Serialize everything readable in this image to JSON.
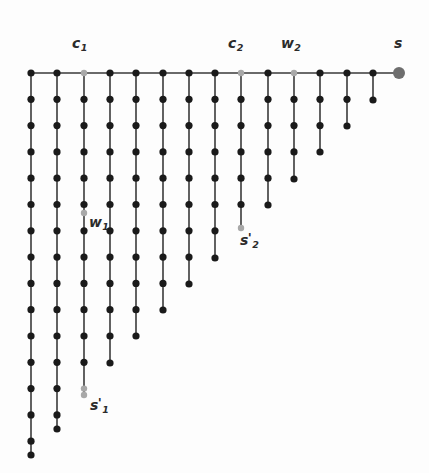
{
  "figure": {
    "background_color": "#fdfdfd",
    "width": 429,
    "height": 473
  },
  "style": {
    "edge_color": "#3a3a3a",
    "edge_width": 1.6,
    "node_color": "#1a1a1a",
    "node_radius": 3.6,
    "highlight_node_color": "#a8a8a8",
    "highlight_node_radius": 3.2,
    "source_node_color": "#6e6e6e",
    "source_node_radius": 6.0,
    "label_color": "#2b2b2b"
  },
  "geometry": {
    "spine_y": 73,
    "x_start": 31,
    "x_step": 26.3,
    "y_step": 26.3,
    "column_count": 15,
    "source_x": 399
  },
  "chart_data": {
    "type": "diagram",
    "spine": {
      "y": 73,
      "nodes_x": [
        31,
        57,
        84,
        110,
        136,
        163,
        189,
        215,
        241,
        268,
        294,
        320,
        347,
        373,
        399
      ],
      "source_node_index": 14
    },
    "columns": [
      {
        "index": 0,
        "x": 31,
        "teeth_count": 15,
        "bottom_y": 455
      },
      {
        "index": 1,
        "x": 57,
        "teeth_count": 14,
        "bottom_y": 429
      },
      {
        "index": 2,
        "x": 84,
        "teeth_count": 13,
        "bottom_y": 395,
        "terminal": "s1prime"
      },
      {
        "index": 3,
        "x": 110,
        "teeth_count": 11,
        "bottom_y": 363
      },
      {
        "index": 4,
        "x": 136,
        "teeth_count": 10,
        "bottom_y": 336
      },
      {
        "index": 5,
        "x": 163,
        "teeth_count": 9,
        "bottom_y": 310
      },
      {
        "index": 6,
        "x": 189,
        "teeth_count": 8,
        "bottom_y": 284
      },
      {
        "index": 7,
        "x": 215,
        "teeth_count": 7,
        "bottom_y": 258
      },
      {
        "index": 8,
        "x": 241,
        "teeth_count": 6,
        "bottom_y": 228,
        "terminal": "s2prime"
      },
      {
        "index": 9,
        "x": 268,
        "teeth_count": 5,
        "bottom_y": 205
      },
      {
        "index": 10,
        "x": 294,
        "teeth_count": 4,
        "bottom_y": 179
      },
      {
        "index": 11,
        "x": 320,
        "teeth_count": 3,
        "bottom_y": 152
      },
      {
        "index": 12,
        "x": 347,
        "teeth_count": 2,
        "bottom_y": 126
      },
      {
        "index": 13,
        "x": 373,
        "teeth_count": 1,
        "bottom_y": 100
      },
      {
        "index": 14,
        "x": 399,
        "teeth_count": 0,
        "bottom_y": 73
      }
    ],
    "highlighted_nodes": [
      {
        "id": "c1",
        "x": 84,
        "y": 73,
        "kind": "spine-gray"
      },
      {
        "id": "c2",
        "x": 241,
        "y": 73,
        "kind": "spine-gray"
      },
      {
        "id": "w2",
        "x": 294,
        "y": 73,
        "kind": "spine-gray"
      },
      {
        "id": "s",
        "x": 399,
        "y": 73,
        "kind": "source"
      },
      {
        "id": "w1",
        "x": 84,
        "y": 213,
        "kind": "gray"
      },
      {
        "id": "s1prime",
        "x": 84,
        "y": 395,
        "kind": "gray"
      },
      {
        "id": "s2prime",
        "x": 241,
        "y": 228,
        "kind": "gray"
      }
    ]
  },
  "labels": [
    {
      "id": "c1",
      "base": "c",
      "sub": "1",
      "prime": "",
      "x": 72,
      "y": 35,
      "anchor": "left"
    },
    {
      "id": "c2",
      "base": "c",
      "sub": "2",
      "prime": "",
      "x": 228,
      "y": 35,
      "anchor": "left"
    },
    {
      "id": "w2",
      "base": "w",
      "sub": "2",
      "prime": "",
      "x": 281,
      "y": 35,
      "anchor": "left"
    },
    {
      "id": "s",
      "base": "s",
      "sub": "",
      "prime": "",
      "x": 394,
      "y": 35,
      "anchor": "left"
    },
    {
      "id": "w1",
      "base": "w",
      "sub": "1",
      "prime": "",
      "x": 89,
      "y": 214,
      "anchor": "left"
    },
    {
      "id": "s1prime",
      "base": "s",
      "sub": "1",
      "prime": "'",
      "x": 90,
      "y": 396,
      "anchor": "left"
    },
    {
      "id": "s2prime",
      "base": "s",
      "sub": "2",
      "prime": "'",
      "x": 240,
      "y": 231,
      "anchor": "left"
    }
  ]
}
